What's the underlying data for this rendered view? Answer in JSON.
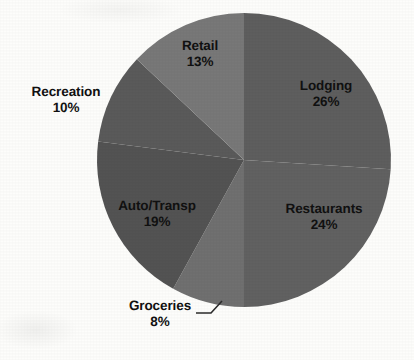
{
  "chart_data": {
    "type": "pie",
    "title": "",
    "subtitle": "",
    "xlabel": "",
    "ylabel": "",
    "legend_position": "none",
    "grid": false,
    "label_format": "category name and percentage",
    "start_angle_deg": 0,
    "direction": "clockwise",
    "categories": [
      "Lodging",
      "Restaurants",
      "Groceries",
      "Auto/Transp",
      "Recreation",
      "Retail"
    ],
    "values": [
      26,
      24,
      8,
      19,
      10,
      13
    ],
    "units": "%",
    "total": 100,
    "slices": [
      {
        "name": "Lodging",
        "value": 26,
        "value_label": "26%",
        "color": "#5e5e5e",
        "label_placement": "inside",
        "leader_line": false
      },
      {
        "name": "Restaurants",
        "value": 24,
        "value_label": "24%",
        "color": "#616161",
        "label_placement": "inside",
        "leader_line": false
      },
      {
        "name": "Groceries",
        "value": 8,
        "value_label": "8%",
        "color": "#707070",
        "label_placement": "outside",
        "leader_line": true
      },
      {
        "name": "Auto/Transp",
        "value": 19,
        "value_label": "19%",
        "color": "#535353",
        "label_placement": "inside",
        "leader_line": false
      },
      {
        "name": "Recreation",
        "value": 10,
        "value_label": "10%",
        "color": "#5a5a5a",
        "label_placement": "outside",
        "leader_line": false
      },
      {
        "name": "Retail",
        "value": 13,
        "value_label": "13%",
        "color": "#787878",
        "label_placement": "inside",
        "leader_line": false
      }
    ]
  },
  "style": {
    "background_color": "#fdfdfb",
    "label_text_color": "#111111",
    "leader_line_color": "#2b2b2b"
  },
  "geometry": {
    "center_x": 244,
    "center_y": 160,
    "radius": 147
  }
}
